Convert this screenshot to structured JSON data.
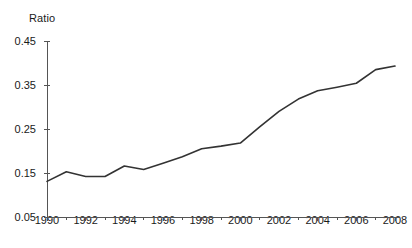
{
  "chart_data": {
    "type": "line",
    "title": "",
    "ylabel": "Ratio",
    "xlabel": "",
    "ylim": [
      0.05,
      0.45
    ],
    "xlim": [
      1990,
      2008
    ],
    "grid": false,
    "legend": false,
    "y_ticks": [
      "0.45",
      "0.35",
      "0.25",
      "0.15",
      "0.05"
    ],
    "y_tick_values": [
      0.45,
      0.35,
      0.25,
      0.15,
      0.05
    ],
    "x_ticks": [
      "1990",
      "1992",
      "1994",
      "1996",
      "1998",
      "2000",
      "2002",
      "2004",
      "2006",
      "2008"
    ],
    "x_tick_values": [
      1990,
      1992,
      1994,
      1996,
      1998,
      2000,
      2002,
      2004,
      2006,
      2008
    ],
    "x_minor_tick_values": [
      1991,
      1993,
      1995,
      1997,
      1999,
      2001,
      2003,
      2005,
      2007
    ],
    "line_color": "#333333",
    "axis_color": "#555555",
    "series": [
      {
        "name": "Ratio",
        "x": [
          1990,
          1991,
          1992,
          1993,
          1994,
          1995,
          1996,
          1997,
          1998,
          1999,
          2000,
          2001,
          2002,
          2003,
          2004,
          2005,
          2006,
          2007,
          2008
        ],
        "values": [
          0.131,
          0.153,
          0.142,
          0.142,
          0.166,
          0.158,
          0.172,
          0.187,
          0.205,
          0.211,
          0.218,
          0.255,
          0.29,
          0.318,
          0.337,
          0.345,
          0.354,
          0.385,
          0.393
        ]
      }
    ]
  }
}
